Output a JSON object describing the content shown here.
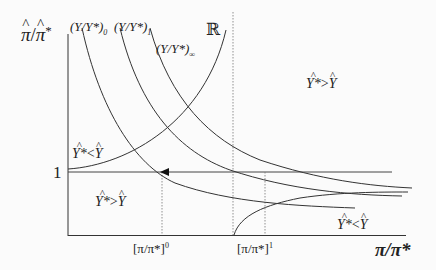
{
  "figure": {
    "y_axis_label": {
      "num": "π",
      "den": "π",
      "star": "*"
    },
    "x_axis_label": {
      "text": "π/π*"
    },
    "tick_one": "1",
    "x_ticks": [
      {
        "base": "[π/π*]",
        "sup": "0"
      },
      {
        "base": "[π/π*]",
        "sup": "1"
      }
    ],
    "curves": [
      {
        "label_base": "(Y/Y*)",
        "label_sub": "0"
      },
      {
        "label_base": "(Y/Y*)",
        "label_sub": "1"
      },
      {
        "label_base": "(Y/Y*)",
        "label_sub": "∞"
      }
    ],
    "r_curve_label": "ℝ",
    "regions": [
      {
        "left": "Y*",
        "op": ">",
        "right": "Y",
        "position": "upper-right"
      },
      {
        "left": "Y*",
        "op": "<",
        "right": "Y",
        "position": "upper-left"
      },
      {
        "left": "Y*",
        "op": ">",
        "right": "Y",
        "position": "lower-left"
      },
      {
        "left": "Y*",
        "op": "<",
        "right": "Y",
        "position": "lower-right"
      }
    ],
    "colors": {
      "line": "#333333",
      "background": "#fbfbfb",
      "dotted": "#777777"
    }
  }
}
